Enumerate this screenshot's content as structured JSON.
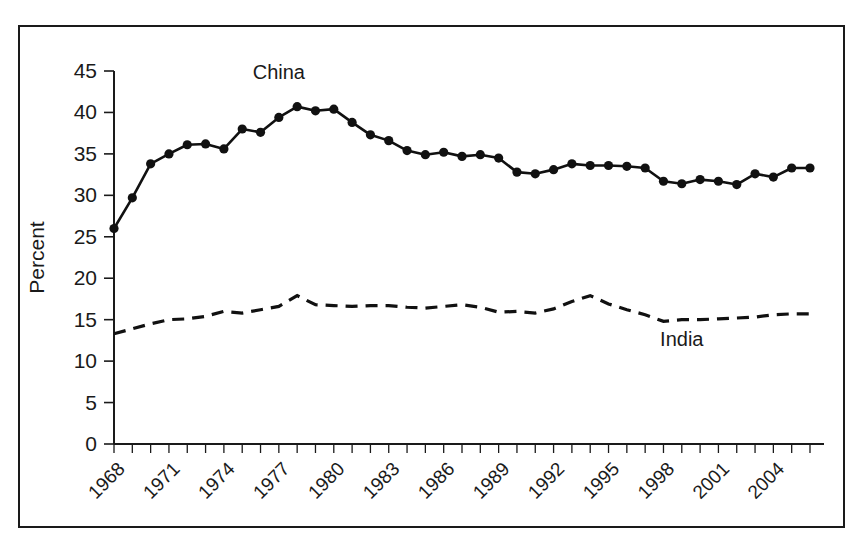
{
  "chart_data": {
    "type": "line",
    "title": "",
    "xlabel": "",
    "ylabel": "Percent",
    "ylim": [
      0,
      45
    ],
    "ytick_step": 5,
    "yticks": [
      0,
      5,
      10,
      15,
      20,
      25,
      30,
      35,
      40,
      45
    ],
    "xlim": [
      1968,
      2006
    ],
    "xticks_labeled": [
      1968,
      1971,
      1974,
      1977,
      1980,
      1983,
      1986,
      1989,
      1992,
      1995,
      1998,
      2001,
      2004
    ],
    "xtick_interval": 1,
    "xtick_label_interval": 3,
    "grid": false,
    "legend_position": "inline-annotations",
    "x": [
      1968,
      1969,
      1970,
      1971,
      1972,
      1973,
      1974,
      1975,
      1976,
      1977,
      1978,
      1979,
      1980,
      1981,
      1982,
      1983,
      1984,
      1985,
      1986,
      1987,
      1988,
      1989,
      1990,
      1991,
      1992,
      1993,
      1994,
      1995,
      1996,
      1997,
      1998,
      1999,
      2000,
      2001,
      2002,
      2003,
      2004,
      2005,
      2006
    ],
    "series": [
      {
        "name": "China",
        "style": "solid-with-markers",
        "color": "#111111",
        "label_x": 1977,
        "label_y": 44.0,
        "values": [
          26.0,
          29.7,
          33.8,
          35.0,
          36.1,
          36.2,
          35.6,
          38.0,
          37.6,
          39.4,
          40.7,
          40.2,
          40.4,
          38.8,
          37.3,
          36.6,
          35.4,
          34.9,
          35.2,
          34.7,
          34.9,
          34.5,
          32.8,
          32.6,
          33.1,
          33.8,
          33.6,
          33.6,
          33.5,
          33.3,
          31.7,
          31.4,
          31.9,
          31.7,
          31.3,
          32.6,
          32.2,
          33.3,
          33.3
        ]
      },
      {
        "name": "India",
        "style": "dashed",
        "color": "#111111",
        "label_x": 1999,
        "label_y": 11.8,
        "values": [
          13.3,
          13.9,
          14.5,
          15.0,
          15.1,
          15.4,
          16.0,
          15.8,
          16.2,
          16.6,
          17.9,
          16.8,
          16.7,
          16.6,
          16.7,
          16.7,
          16.5,
          16.4,
          16.6,
          16.8,
          16.5,
          15.9,
          16.0,
          15.8,
          16.3,
          17.2,
          17.9,
          16.9,
          16.2,
          15.6,
          14.8,
          15.0,
          15.0,
          15.1,
          15.2,
          15.3,
          15.6,
          15.7,
          15.7
        ]
      }
    ]
  },
  "annotations": {
    "china_label": "China",
    "india_label": "India"
  }
}
